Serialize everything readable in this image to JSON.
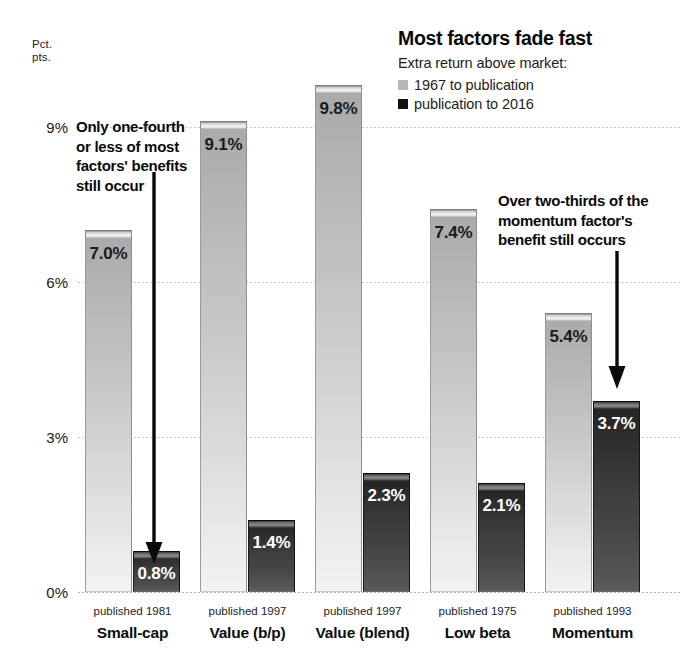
{
  "header": {
    "title": "Most factors fade fast",
    "subtitle": "Extra return above market:",
    "legend": [
      {
        "label": "1967 to publication",
        "color": "#b7b7b7",
        "swatch_name": "legend-swatch-light"
      },
      {
        "label": "publication to 2016",
        "color": "#111111",
        "swatch_name": "legend-swatch-dark"
      }
    ]
  },
  "axis": {
    "unit_line1": "Pct.",
    "unit_line2": "pts.",
    "ticks": [
      "9%",
      "6%",
      "3%",
      "0%"
    ]
  },
  "annotations": {
    "left": {
      "lines": [
        "Only one-fourth",
        "or less of most",
        "factors' benefits",
        "still occur"
      ],
      "arrow": "down-arrow-icon"
    },
    "right": {
      "lines": [
        "Over two-thirds of the",
        "momentum factor's",
        "benefit still occurs"
      ],
      "arrow": "down-arrow-icon"
    }
  },
  "chart_data": {
    "type": "bar",
    "title": "Most factors fade fast",
    "subtitle": "Extra return above market:",
    "xlabel": "",
    "ylabel": "Pct. pts.",
    "ylim": [
      0,
      10.5
    ],
    "yticks": [
      0,
      3,
      6,
      9
    ],
    "ytick_labels": [
      "0%",
      "3%",
      "6%",
      "9%"
    ],
    "grid": true,
    "legend_position": "top-right",
    "categories": [
      "Small-cap",
      "Value (b/p)",
      "Value (blend)",
      "Low beta",
      "Momentum"
    ],
    "category_sublabels": [
      "published 1981",
      "published 1997",
      "published 1997",
      "published 1975",
      "published 1993"
    ],
    "series": [
      {
        "name": "1967 to publication",
        "color": "#b7b7b7",
        "values": [
          7.0,
          9.1,
          9.8,
          7.4,
          5.4
        ],
        "value_labels": [
          "7.0%",
          "9.1%",
          "9.8%",
          "7.4%",
          "5.4%"
        ]
      },
      {
        "name": "publication to 2016",
        "color": "#111111",
        "values": [
          0.8,
          1.4,
          2.3,
          2.1,
          3.7
        ],
        "value_labels": [
          "0.8%",
          "1.4%",
          "2.3%",
          "2.1%",
          "3.7%"
        ]
      }
    ]
  }
}
